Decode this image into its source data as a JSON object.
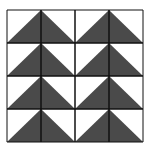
{
  "diagram": {
    "type": "quilt-pattern",
    "grid": {
      "rows": 4,
      "cols": 4,
      "x0": 7,
      "y0": 10,
      "cell_w": 34,
      "cell_h": 33
    },
    "colors": {
      "fill": "#4a4a4a",
      "background": "#ffffff",
      "line": "#111111"
    },
    "triangles_per_row": 2
  }
}
